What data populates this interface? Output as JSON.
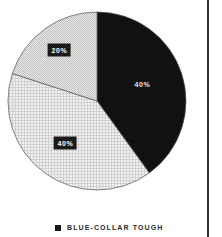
{
  "chart_data": {
    "type": "pie",
    "title": "",
    "start_angle_deg": 0,
    "direction": "clockwise",
    "slices": [
      {
        "label": "Blue-Collar Tough",
        "value": 40,
        "display": "40%",
        "fill": "#111111",
        "pattern": "solid"
      },
      {
        "label": "",
        "value": 40,
        "display": "40%",
        "fill": "#e6e6e6",
        "pattern": "light-grid"
      },
      {
        "label": "",
        "value": 20,
        "display": "20%",
        "fill": "#d8d8d8",
        "pattern": "checker"
      }
    ],
    "legend": {
      "position": "bottom",
      "entries": [
        {
          "label": "BLUE-COLLAR TOUGH",
          "color": "#1a1a1a"
        }
      ]
    }
  },
  "labels": {
    "slice0": "40%",
    "slice1": "40%",
    "slice2": "20%"
  },
  "legend": {
    "label": "BLUE-COLLAR TOUGH"
  },
  "colors": {
    "dark": "#111111",
    "outline": "#555555",
    "divider": "#333333"
  }
}
